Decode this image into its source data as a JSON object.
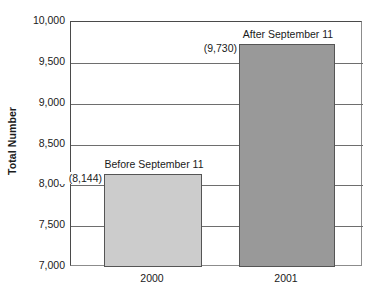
{
  "chart_data": {
    "type": "bar",
    "title": "",
    "xlabel": "",
    "ylabel": "Total Number",
    "ylim": [
      7000,
      10000
    ],
    "ytick_labels": [
      "10,000",
      "9,500",
      "9,000",
      "8,500",
      "8,000",
      "7,500",
      "7,000"
    ],
    "ytick_values": [
      10000,
      9500,
      9000,
      8500,
      8000,
      7500,
      7000
    ],
    "grid": true,
    "legend": "none",
    "categories": [
      "2000",
      "2001"
    ],
    "values": [
      8144,
      9730
    ],
    "value_labels": [
      "(8,144)",
      "(9,730)"
    ],
    "annotations": [
      "Before September 11",
      "After September 11"
    ],
    "bar_colors": [
      "#cccccc",
      "#999999"
    ],
    "bar_border_color": "#555555",
    "series": [
      {
        "name": "Total Number",
        "points": [
          {
            "category": "2000",
            "value": 8144,
            "value_label": "(8,144)",
            "annotation": "Before September 11",
            "color": "#cccccc"
          },
          {
            "category": "2001",
            "value": 9730,
            "value_label": "(9,730)",
            "annotation": "After September 11",
            "color": "#999999"
          }
        ]
      }
    ]
  }
}
